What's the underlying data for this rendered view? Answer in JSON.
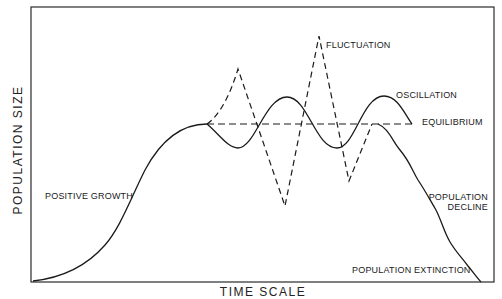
{
  "diagram": {
    "axes": {
      "y_label": "POPULATION  SIZE",
      "x_label": "TIME  SCALE"
    },
    "labels": {
      "positive_growth": "POSITIVE GROWTH",
      "fluctuation": "FLUCTUATION",
      "oscillation": "OSCILLATION",
      "equilibrium": "EQUILIBRIUM",
      "population_decline_line1": "POPULATION",
      "population_decline_line2": "DECLINE",
      "population_extinction": "POPULATION EXTINCTION"
    },
    "curves": [
      {
        "name": "Positive growth",
        "style": "solid"
      },
      {
        "name": "Equilibrium",
        "style": "dashed"
      },
      {
        "name": "Fluctuation",
        "style": "dashed"
      },
      {
        "name": "Oscillation",
        "style": "solid"
      },
      {
        "name": "Population decline / extinction",
        "style": "solid"
      }
    ],
    "colors": {
      "ink": "#1a1a1a",
      "background": "#ffffff"
    }
  }
}
